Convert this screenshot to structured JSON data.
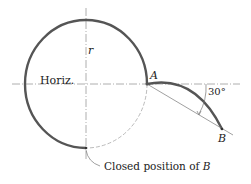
{
  "labels": {
    "r": "r",
    "horiz": "Horiz.",
    "A": "A",
    "B": "B",
    "angle": "30°",
    "closed_prefix": "Closed position of ",
    "closed_B": "B"
  },
  "colors": {
    "stroke": "#555555",
    "thin": "#888888",
    "text": "#222222"
  }
}
